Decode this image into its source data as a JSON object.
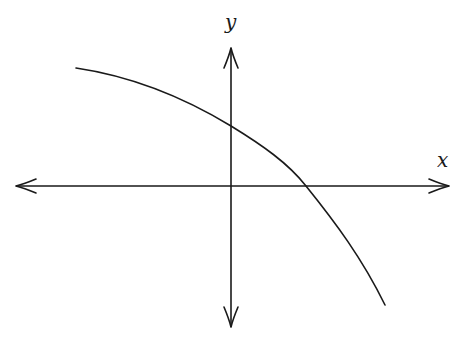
{
  "diagram": {
    "type": "function-graph",
    "axes": {
      "x_label": "x",
      "y_label": "y",
      "color": "#1a1a1a"
    },
    "curve": {
      "shape": "concave-down, decreasing",
      "crosses_y_axis": "positive y-intercept",
      "crosses_x_axis": "positive x-intercept",
      "color": "#1a1a1a"
    }
  }
}
